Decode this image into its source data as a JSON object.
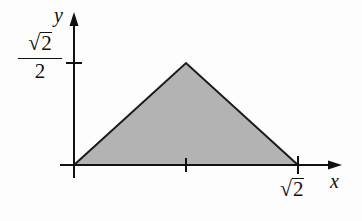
{
  "diagram": {
    "type": "shaded-triangle-on-axes",
    "axes": {
      "x_label": "x",
      "y_label": "y"
    },
    "ticks": {
      "x_end_label_radicand": "2",
      "x_end_label_radical": "√",
      "y_top_label_numerator_radicand": "2",
      "y_top_label_numerator_radical": "√",
      "y_top_label_denominator": "2"
    },
    "shape": {
      "vertices": [
        [
          0,
          0
        ],
        [
          "√2/2",
          "√2/2"
        ],
        [
          "√2",
          0
        ]
      ],
      "fill_color": "#b3b3b3",
      "stroke_color": "#1a1a1a"
    }
  }
}
